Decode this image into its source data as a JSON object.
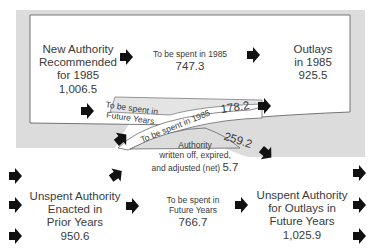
{
  "diagram": {
    "top_box": {
      "source": {
        "lines": [
          "New Authority",
          "Recommended",
          "for 1985"
        ],
        "value": "1,006.5"
      },
      "spent_1985": {
        "label": "To be spent in 1985",
        "value": "747.3"
      },
      "outlays": {
        "lines": [
          "Outlays",
          "in 1985"
        ],
        "value": "925.5"
      }
    },
    "crossing": {
      "future_band_label": [
        "To be spent in",
        "Future Years"
      ],
      "spent_1985_band_label": "To be spent in 1985",
      "spent_1985_band_value": "178.2",
      "future_band_value": "259.2",
      "written_off": {
        "lines": [
          "Authority",
          "written off, expired,",
          "and adjusted"
        ],
        "net_label": "(net)",
        "value": "5.7"
      }
    },
    "bottom": {
      "unspent_prior": {
        "lines": [
          "Unspent Authority",
          "Enacted in",
          "Prior Years"
        ],
        "value": "950.6"
      },
      "spent_future": {
        "lines": [
          "To be spent in",
          "Future Years"
        ],
        "value": "766.7"
      },
      "unspent_future": {
        "lines": [
          "Unspent Authority",
          "for Outlays in",
          "Future Years"
        ],
        "value": "1,025.9"
      }
    },
    "colors": {
      "band_gray": "#dedede",
      "border": "#555555",
      "arrow": "#111111"
    }
  }
}
